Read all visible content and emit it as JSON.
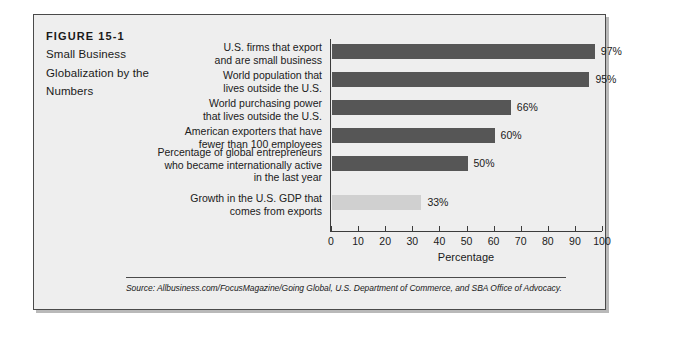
{
  "figure": {
    "number": "FIGURE 15-1",
    "title": "Small Business Globalization by the Numbers",
    "source": "Source: Allbusiness.com/FocusMagazine/Going Global, U.S. Department of Commerce, and SBA Office of Advocacy."
  },
  "chart_data": {
    "type": "bar",
    "orientation": "horizontal",
    "title": "Small Business Globalization by the Numbers",
    "xlabel": "Percentage",
    "ylabel": "",
    "xlim": [
      0,
      100
    ],
    "xticks": [
      0,
      10,
      20,
      30,
      40,
      50,
      60,
      70,
      80,
      90,
      100
    ],
    "grid": false,
    "legend": "none",
    "categories": [
      "U.S. firms that export\nand are small business",
      "World population that\nlives outside the U.S.",
      "World purchasing power\nthat lives outside the U.S.",
      "American exporters that have\nfewer than 100 employees",
      "Percentage of global entrepreneurs\nwho became internationally active\nin the last year",
      "Growth in the U.S. GDP that\ncomes from exports"
    ],
    "values": [
      97,
      95,
      66,
      60,
      50,
      33
    ],
    "value_labels": [
      "97%",
      "95%",
      "66%",
      "60%",
      "50%",
      "33%"
    ],
    "bar_colors": [
      "#565656",
      "#565656",
      "#565656",
      "#565656",
      "#565656",
      "#d0d0d0"
    ]
  },
  "colors": {
    "panel_background": "#eeeeee",
    "panel_border": "#4a4a4a",
    "bar_dark": "#565656",
    "bar_light": "#d0d0d0",
    "text": "#1a1a1a",
    "axis": "#3c3c3c"
  }
}
